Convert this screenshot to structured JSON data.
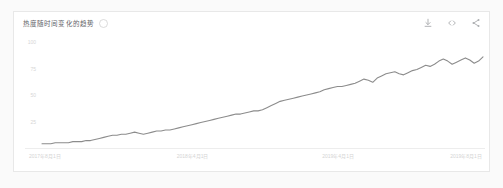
{
  "card": {
    "title": "热度随时间变化的趋势",
    "info_icon": "info-icon"
  },
  "actions": [
    {
      "name": "download-icon",
      "label": "下载"
    },
    {
      "name": "embed-icon",
      "label": "嵌入"
    },
    {
      "name": "share-icon",
      "label": "分享"
    }
  ],
  "colors": {
    "line": "#8c8c8c",
    "card_background": "#ffffff",
    "page_background": "#fafafa",
    "border": "#e8e8e8",
    "axis_label": "#d4d4d4",
    "baseline": "#ededed"
  },
  "chart_data": {
    "type": "line",
    "title": "热度随时间变化的趋势",
    "xlabel": "",
    "ylabel": "",
    "ylim": [
      0,
      100
    ],
    "yticks": [
      100,
      75,
      50,
      25
    ],
    "ytick_labels": [
      "100",
      "75",
      "50",
      "25"
    ],
    "grid": false,
    "legend": "none",
    "xtick_labels": [
      "2017年8月1日",
      "2018年4月1日",
      "2019年4月1日",
      "2019年8月1日"
    ],
    "xtick_positions": [
      0,
      0.335,
      0.665,
      0.955
    ],
    "x": [
      0,
      1,
      2,
      3,
      4,
      5,
      6,
      7,
      8,
      9,
      10,
      11,
      12,
      13,
      14,
      15,
      16,
      17,
      18,
      19,
      20,
      21,
      22,
      23,
      24,
      25,
      26,
      27,
      28,
      29,
      30,
      31,
      32,
      33,
      34,
      35,
      36,
      37,
      38,
      39,
      40,
      41,
      42,
      43,
      44,
      45,
      46,
      47,
      48,
      49,
      50,
      51,
      52,
      53,
      54,
      55,
      56,
      57,
      58,
      59,
      60,
      61,
      62,
      63,
      64,
      65,
      66,
      67,
      68,
      69,
      70,
      71,
      72,
      73,
      74,
      75,
      76,
      77,
      78,
      79,
      80,
      81,
      82,
      83,
      84,
      85,
      86,
      87,
      88,
      89,
      90,
      91,
      92,
      93,
      94,
      95,
      96,
      97,
      98,
      99,
      100
    ],
    "values": [
      4,
      4,
      4,
      5,
      5,
      5,
      5,
      6,
      6,
      6,
      7,
      7,
      8,
      9,
      10,
      11,
      12,
      12,
      13,
      13,
      14,
      15,
      14,
      13,
      14,
      15,
      16,
      16,
      17,
      17,
      18,
      19,
      20,
      21,
      22,
      23,
      24,
      25,
      26,
      27,
      28,
      29,
      30,
      31,
      32,
      32,
      33,
      34,
      35,
      35,
      36,
      38,
      40,
      42,
      44,
      45,
      46,
      47,
      48,
      49,
      50,
      51,
      52,
      53,
      55,
      56,
      57,
      58,
      58,
      59,
      60,
      61,
      63,
      65,
      64,
      62,
      66,
      68,
      70,
      71,
      72,
      70,
      69,
      71,
      73,
      74,
      76,
      78,
      77,
      79,
      82,
      84,
      82,
      79,
      81,
      83,
      85,
      83,
      80,
      82,
      86
    ],
    "series": [
      {
        "name": "热度",
        "values": [
          4,
          4,
          4,
          5,
          5,
          5,
          5,
          6,
          6,
          6,
          7,
          7,
          8,
          9,
          10,
          11,
          12,
          12,
          13,
          13,
          14,
          15,
          14,
          13,
          14,
          15,
          16,
          16,
          17,
          17,
          18,
          19,
          20,
          21,
          22,
          23,
          24,
          25,
          26,
          27,
          28,
          29,
          30,
          31,
          32,
          32,
          33,
          34,
          35,
          35,
          36,
          38,
          40,
          42,
          44,
          45,
          46,
          47,
          48,
          49,
          50,
          51,
          52,
          53,
          55,
          56,
          57,
          58,
          58,
          59,
          60,
          61,
          63,
          65,
          64,
          62,
          66,
          68,
          70,
          71,
          72,
          70,
          69,
          71,
          73,
          74,
          76,
          78,
          77,
          79,
          82,
          84,
          82,
          79,
          81,
          83,
          85,
          83,
          80,
          82,
          86
        ]
      }
    ]
  }
}
